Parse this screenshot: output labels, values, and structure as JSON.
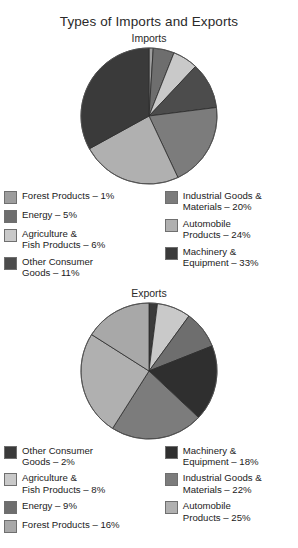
{
  "title": "Types of Imports and Exports",
  "chart_data": [
    {
      "type": "pie",
      "title": "Imports",
      "start_angle": 0,
      "direction": "clockwise",
      "categories": [
        "Forest Products",
        "Energy",
        "Agriculture & Fish Products",
        "Other Consumer Goods",
        "Industrial Goods & Materials",
        "Automobile Products",
        "Machinery & Equipment"
      ],
      "values": [
        1,
        5,
        6,
        11,
        20,
        24,
        33
      ],
      "unit": "%",
      "colors": [
        "#9d9d9d",
        "#6e6e6e",
        "#c9c9c9",
        "#4c4c4c",
        "#7c7c7c",
        "#b0b0b0",
        "#3a3a3a"
      ],
      "legend_position": "below",
      "legend": [
        {
          "label": "Forest Products – 1%",
          "color": "#9d9d9d"
        },
        {
          "label": "Energy – 5%",
          "color": "#6e6e6e"
        },
        {
          "label": "Agriculture &\nFish Products – 6%",
          "color": "#c9c9c9"
        },
        {
          "label": "Other Consumer\nGoods – 11%",
          "color": "#4c4c4c"
        },
        {
          "label": "Industrial Goods &\nMaterials – 20%",
          "color": "#7c7c7c"
        },
        {
          "label": "Automobile\nProducts – 24%",
          "color": "#b0b0b0"
        },
        {
          "label": "Machinery &\nEquipment – 33%",
          "color": "#3a3a3a"
        }
      ]
    },
    {
      "type": "pie",
      "title": "Exports",
      "start_angle": 0,
      "direction": "clockwise",
      "categories": [
        "Other Consumer Goods",
        "Agriculture & Fish Products",
        "Energy",
        "Machinery & Equipment",
        "Industrial Goods & Materials",
        "Automobile Products",
        "Forest Products"
      ],
      "values": [
        2,
        8,
        9,
        18,
        22,
        25,
        16
      ],
      "unit": "%",
      "colors": [
        "#3a3a3a",
        "#c9c9c9",
        "#6e6e6e",
        "#2f2f2f",
        "#7c7c7c",
        "#b0b0b0",
        "#a8a8a8"
      ],
      "legend_position": "below",
      "legend": [
        {
          "label": "Other Consumer\nGoods – 2%",
          "color": "#3a3a3a"
        },
        {
          "label": "Agriculture &\nFish Products – 8%",
          "color": "#c9c9c9"
        },
        {
          "label": "Energy – 9%",
          "color": "#6e6e6e"
        },
        {
          "label": "Forest Products – 16%",
          "color": "#a8a8a8"
        },
        {
          "label": "Machinery &\nEquipment – 18%",
          "color": "#2f2f2f"
        },
        {
          "label": "Industrial Goods &\nMaterials – 22%",
          "color": "#7c7c7c"
        },
        {
          "label": "Automobile\nProducts – 25%",
          "color": "#b0b0b0"
        }
      ]
    }
  ]
}
